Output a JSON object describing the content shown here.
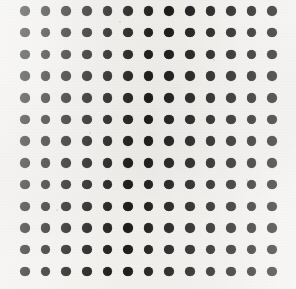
{
  "figure": {
    "name": "dot-grid-pattern",
    "width": 296,
    "height": 289,
    "background_color": "#f7f6f3",
    "dot_color": "#1c1c1c",
    "has_text": false,
    "has_axes": false,
    "has_labels": false
  },
  "chart_data": {
    "type": "scatter",
    "title": "",
    "subtitle": "",
    "xlabel": "",
    "ylabel": "",
    "grid": false,
    "legend": null,
    "annotations": [],
    "marker": {
      "shape": "circle",
      "filled": true,
      "color": "#1c1c1c",
      "diameter_px": 9.5
    },
    "layout": {
      "rows": 13,
      "columns": 13,
      "total_points": 169,
      "origin_x_px": 25,
      "origin_y_px": 11,
      "spacing_x_px": 20.6,
      "spacing_y_px": 21.7,
      "last_column_x_px": 272,
      "last_row_y_px": 271,
      "xlim": [
        0,
        296
      ],
      "ylim": [
        0,
        289
      ]
    },
    "x": [
      25,
      45.6,
      66.2,
      86.8,
      107.4,
      128,
      148.6,
      169.2,
      189.8,
      210.4,
      231,
      251.6,
      272.2
    ],
    "y": [
      11,
      32.7,
      54.4,
      76.1,
      97.8,
      119.5,
      141.2,
      162.9,
      184.6,
      206.3,
      228,
      249.7,
      271.4
    ]
  },
  "speckles": [
    {
      "x": 90,
      "y": 133,
      "r": 1.4
    },
    {
      "x": 214,
      "y": 60,
      "r": 1.1
    },
    {
      "x": 57,
      "y": 210,
      "r": 1.2
    },
    {
      "x": 168,
      "y": 246,
      "r": 1.0
    },
    {
      "x": 247,
      "y": 180,
      "r": 1.3
    },
    {
      "x": 120,
      "y": 22,
      "r": 0.9
    }
  ]
}
